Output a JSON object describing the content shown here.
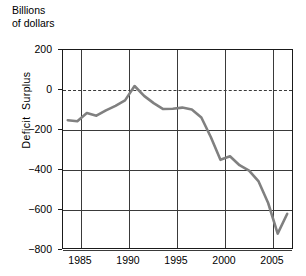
{
  "chart_data": {
    "type": "line",
    "title_line1": "Billions",
    "title_line2": "of dollars",
    "xlabel": "",
    "ylabel": "Deficit  Surplus",
    "ylabel_parts": [
      "Deficit",
      "Surplus"
    ],
    "units": "Billions of dollars",
    "xlim": [
      1983.5,
      2007.5
    ],
    "ylim": [
      -900,
      200
    ],
    "yticks": [
      200,
      0,
      -200,
      -400,
      -600,
      -800
    ],
    "ytick_labels": [
      "200",
      "0",
      "−200",
      "−400",
      "−600",
      "−800"
    ],
    "xticks": [
      1985,
      1990,
      1995,
      2000,
      2005
    ],
    "xtick_labels": [
      "1985",
      "1990",
      "1995",
      "2000",
      "2005"
    ],
    "grid": true,
    "zero_reference_line": {
      "value": 0,
      "style": "dashed"
    },
    "legend": null,
    "series": [
      {
        "name": "Federal budget deficit/surplus",
        "color": "#808080",
        "x": [
          1984,
          1985,
          1986,
          1987,
          1988,
          1989,
          1990,
          1991,
          1992,
          1993,
          1994,
          1995,
          1996,
          1997,
          1998,
          1999,
          2000,
          2001,
          2002,
          2003,
          2004,
          2005,
          2006,
          2007
        ],
        "values": [
          -190,
          -196,
          -150,
          -165,
          -135,
          -110,
          -80,
          0,
          -55,
          -95,
          -128,
          -126,
          -120,
          -130,
          -175,
          -285,
          -410,
          -390,
          -440,
          -470,
          -530,
          -650,
          -820,
          -710
        ]
      }
    ]
  },
  "axes": {
    "y_title": "Deficit  Surplus",
    "units_caption_line1": "Billions",
    "units_caption_line2": "of dollars"
  }
}
